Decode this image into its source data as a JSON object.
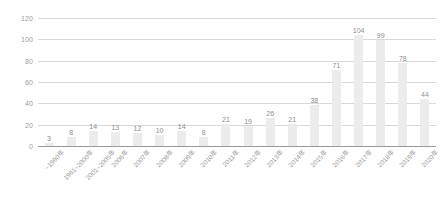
{
  "chart_data": {
    "type": "bar",
    "title": "",
    "subtitle": "",
    "xlabel": "",
    "ylabel": "",
    "ylim": [
      0,
      120
    ],
    "yticks": [
      0,
      20,
      40,
      60,
      80,
      100,
      120
    ],
    "grid": true,
    "legend": null,
    "categories": [
      "~1990年",
      "1991~2000年",
      "2001~2005年",
      "2006年",
      "2007年",
      "2008年",
      "2009年",
      "2010年",
      "2011年",
      "2012年",
      "2013年",
      "2014年",
      "2015年",
      "2016年",
      "2017年",
      "2018年",
      "2019年",
      "2020年"
    ],
    "values": [
      3,
      8,
      14,
      13,
      12,
      10,
      14,
      8,
      21,
      19,
      26,
      21,
      38,
      71,
      104,
      99,
      78,
      44
    ],
    "value_labels": [
      "3",
      "8",
      "14",
      "13",
      "12",
      "10",
      "14",
      "8",
      "21",
      "19",
      "26",
      "21",
      "38",
      "71",
      "104",
      "99",
      "78",
      "44"
    ],
    "colors": {
      "bar": "#ececec",
      "gridline": "#d9d9d9",
      "baseline": "#9a9a9a",
      "tick_text": "#9b9b9b",
      "value_text": "#8d8d8d",
      "background": "#ffffff"
    }
  }
}
